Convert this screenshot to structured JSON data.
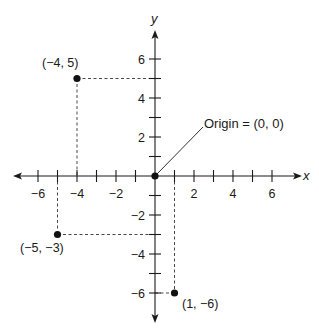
{
  "diagram": {
    "type": "coordinate-plane",
    "axes": {
      "x": {
        "name": "x",
        "min": -7,
        "max": 7,
        "ticks": [
          -6,
          -5,
          -4,
          -3,
          -2,
          -1,
          1,
          2,
          3,
          4,
          5,
          6
        ],
        "labeled_ticks": [
          -6,
          -4,
          -2,
          2,
          4,
          6
        ]
      },
      "y": {
        "name": "y",
        "min": -7,
        "max": 7,
        "ticks": [
          -6,
          -5,
          -4,
          -3,
          -2,
          -1,
          1,
          2,
          3,
          4,
          5,
          6
        ],
        "labeled_ticks": [
          -6,
          -4,
          -2,
          2,
          4,
          6
        ]
      }
    },
    "labels": {
      "x_axis": "x",
      "y_axis": "y",
      "x_ticks": {
        "m6": "−6",
        "m4": "−4",
        "m2": "−2",
        "p2": "2",
        "p4": "4",
        "p6": "6"
      },
      "y_ticks": {
        "m6": "−6",
        "m4": "−4",
        "m2": "−2",
        "p2": "2",
        "p4": "4",
        "p6": "6"
      }
    },
    "points": [
      {
        "x": -4,
        "y": 5,
        "label": "(−4, 5)"
      },
      {
        "x": -5,
        "y": -3,
        "label": "(−5, −3)"
      },
      {
        "x": 1,
        "y": -6,
        "label": "(1, −6)"
      },
      {
        "x": 0,
        "y": 0,
        "label": ""
      }
    ],
    "annotation": {
      "text": "Origin = (0, 0)",
      "target": [
        0,
        0
      ]
    },
    "colors": {
      "ink": "#1a1a1a",
      "background": "#ffffff"
    }
  }
}
